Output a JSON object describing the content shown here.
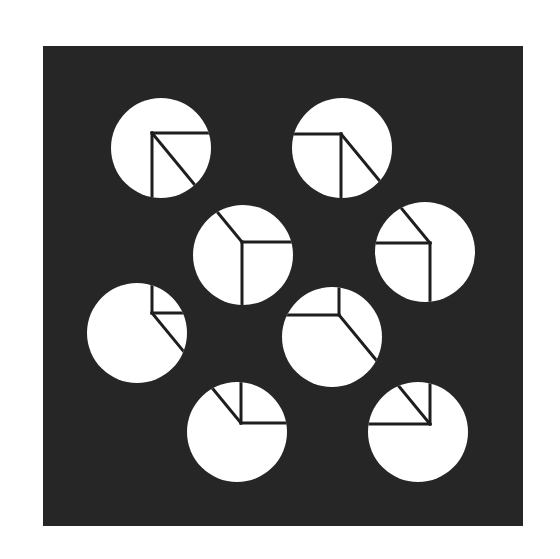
{
  "figure": {
    "background_color": "#ffffff",
    "panel_color": "#262626",
    "disc_color": "#ffffff",
    "edge_color": "#1e1e1e"
  },
  "discs": [
    {
      "name": "front-top-left",
      "edges": [
        "right",
        "down",
        "diag-down-right"
      ]
    },
    {
      "name": "front-top-right",
      "edges": [
        "left",
        "down",
        "diag-down-right"
      ]
    },
    {
      "name": "back-top-left",
      "edges": [
        "right",
        "down",
        "diag-up-left"
      ]
    },
    {
      "name": "back-top-right",
      "edges": [
        "left",
        "down",
        "diag-up-left"
      ]
    },
    {
      "name": "front-bottom-left",
      "edges": [
        "right",
        "up",
        "diag-down-right"
      ]
    },
    {
      "name": "front-bottom-right",
      "edges": [
        "left",
        "up",
        "diag-down-right"
      ]
    },
    {
      "name": "back-bottom-left",
      "edges": [
        "right",
        "up",
        "diag-up-left"
      ]
    },
    {
      "name": "back-bottom-right",
      "edges": [
        "left",
        "up",
        "diag-up-left"
      ]
    }
  ]
}
